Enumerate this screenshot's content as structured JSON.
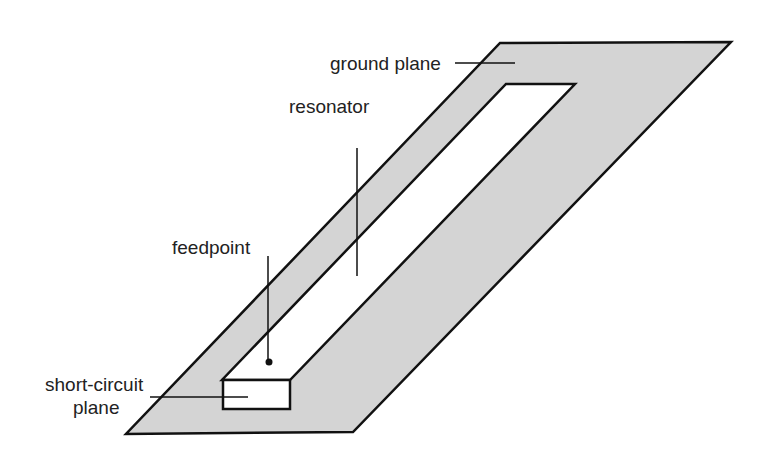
{
  "diagram": {
    "type": "antenna-schematic",
    "colors": {
      "ground_fill": "#d4d4d4",
      "slot_fill": "#ffffff",
      "stroke": "#111111",
      "text": "#222222"
    },
    "labels": {
      "ground_plane": "ground plane",
      "resonator": "resonator",
      "feedpoint": "feedpoint",
      "short_circuit_line1": "short-circuit",
      "short_circuit_line2": "plane"
    }
  }
}
